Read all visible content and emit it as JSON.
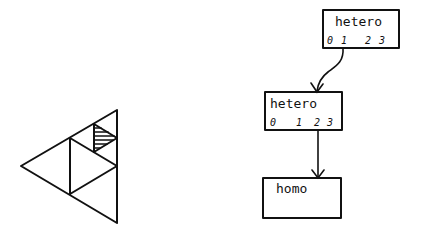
{
  "left_figure": {
    "description": "Triangle subdivision with a hatched small triangle",
    "shape": "triangle"
  },
  "tree": {
    "nodes": [
      {
        "id": "node-1",
        "label": "hetero",
        "indices": [
          "0",
          "1",
          "2",
          "3"
        ]
      },
      {
        "id": "node-2",
        "label": "hetero",
        "indices": [
          "0",
          "1",
          "2",
          "3"
        ]
      },
      {
        "id": "node-3",
        "label": "homo",
        "indices": []
      }
    ],
    "edges": [
      {
        "from": "node-1",
        "from_index": "1",
        "to": "node-2"
      },
      {
        "from": "node-2",
        "from_index": "2",
        "to": "node-3"
      }
    ]
  },
  "colors": {
    "ink": "#111111",
    "background": "#ffffff"
  }
}
